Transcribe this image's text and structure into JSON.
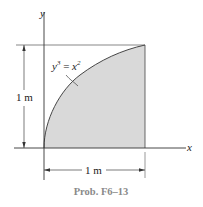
{
  "diagram": {
    "axes": {
      "x_label": "x",
      "y_label": "y"
    },
    "equation": {
      "lhs": "y",
      "lhs_exp": "3",
      "eq": " = ",
      "rhs": "x",
      "rhs_exp": "2"
    },
    "dimensions": {
      "height": "1 m",
      "width": "1 m"
    },
    "caption": "Prob. F6–13",
    "colors": {
      "shade": "#d9d9d9",
      "line": "#333333"
    }
  }
}
